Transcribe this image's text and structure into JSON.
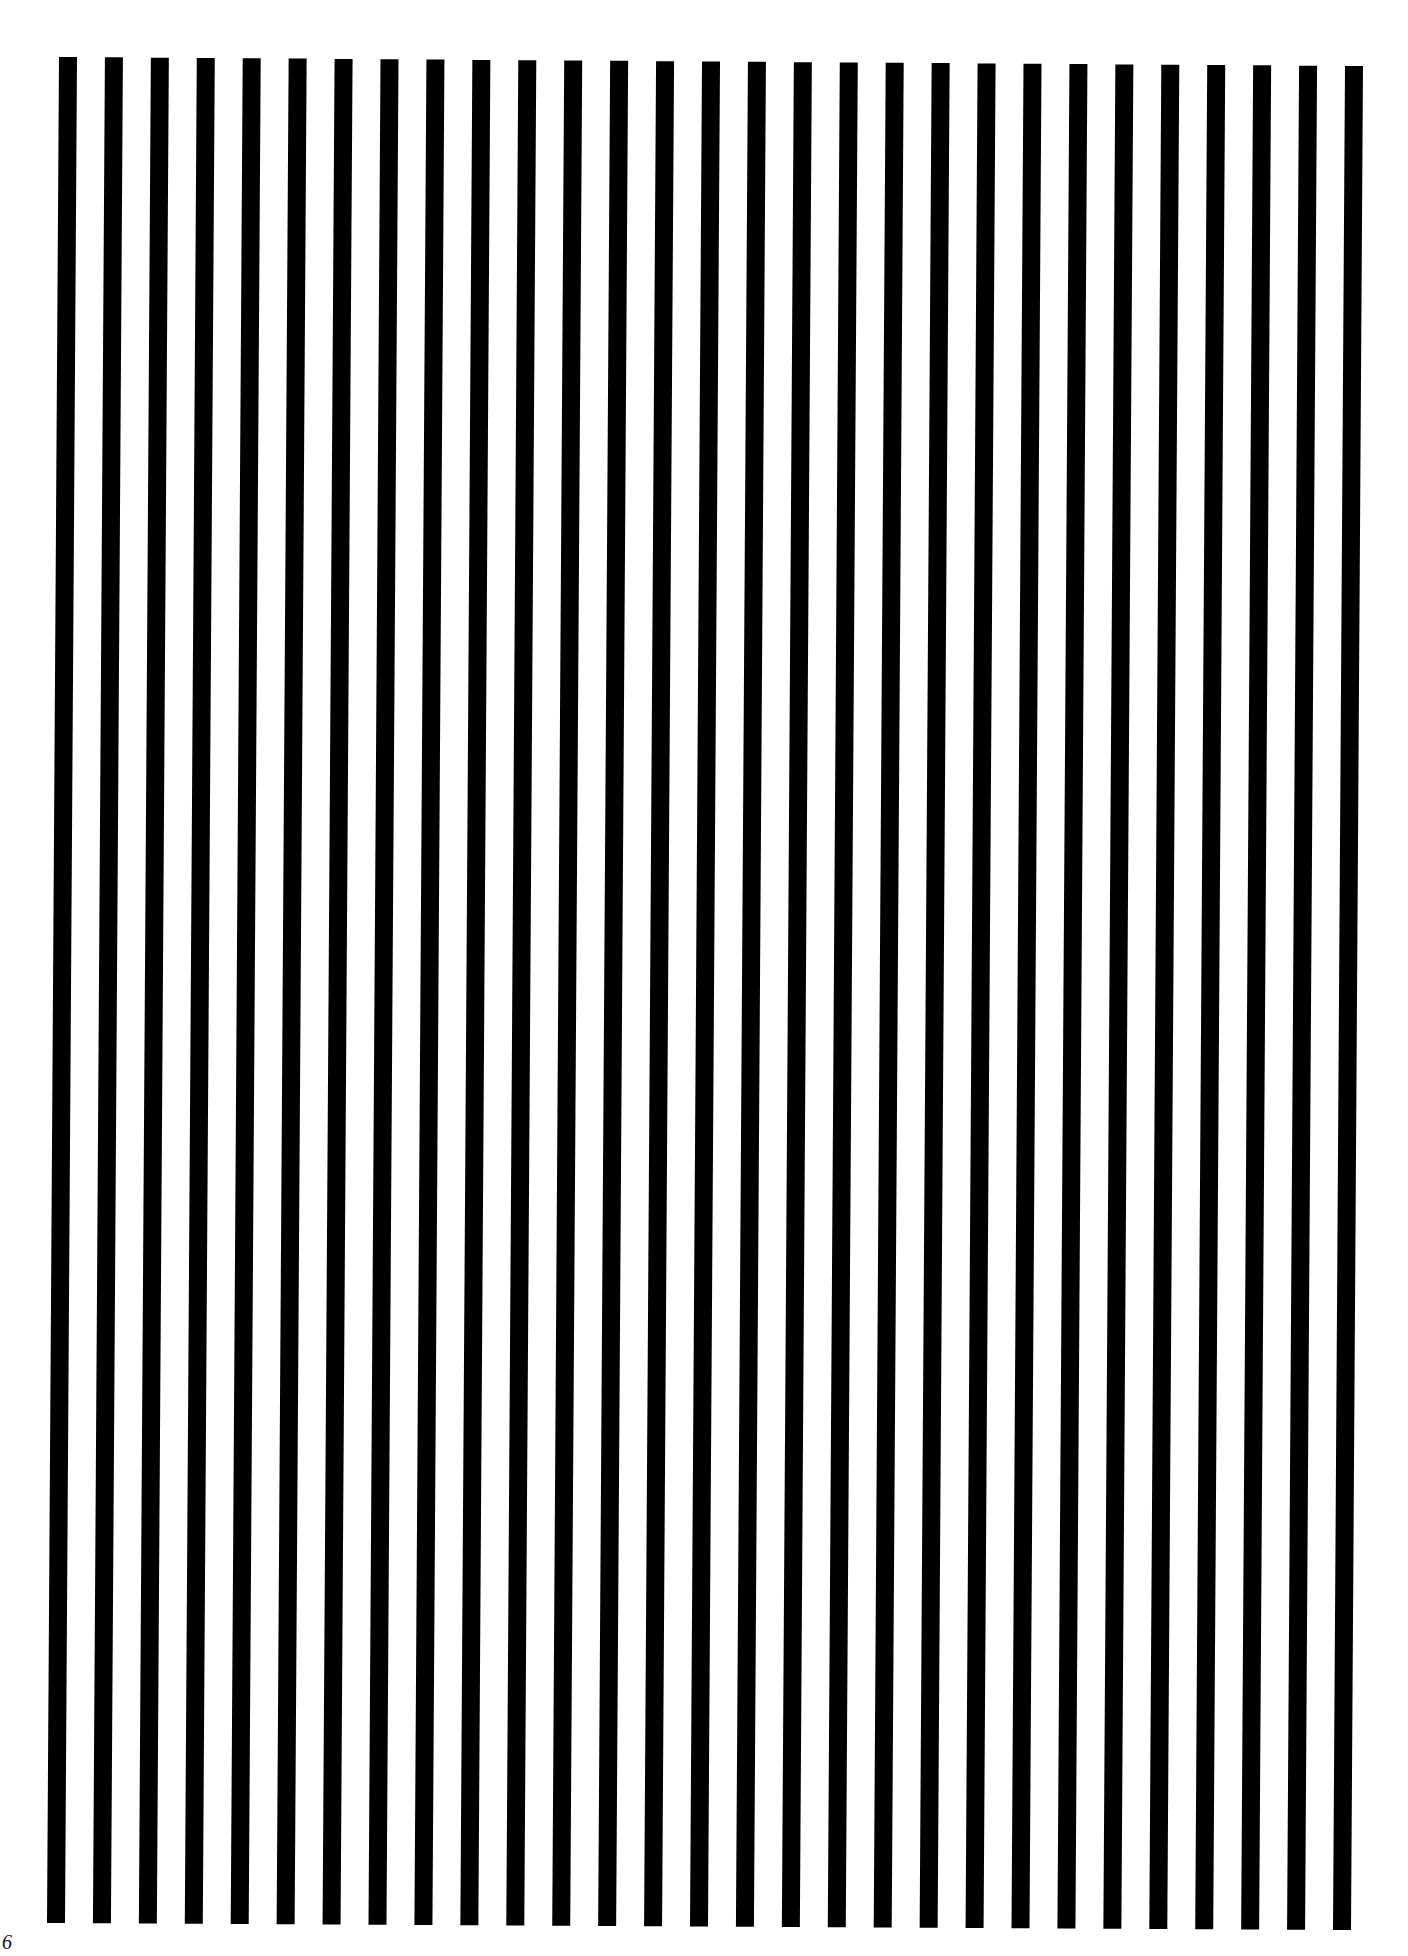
{
  "page": {
    "background": "#ffffff",
    "stripe_color": "#000000",
    "page_number": "6"
  },
  "stripes": {
    "count": 29,
    "width": 18,
    "top_left": {
      "x": 59,
      "y": 57
    },
    "top_right": {
      "x": 1345,
      "y": 66
    },
    "bottom_left": {
      "x": 47,
      "y": 1923
    },
    "bottom_right": {
      "x": 1333,
      "y": 1930
    }
  }
}
